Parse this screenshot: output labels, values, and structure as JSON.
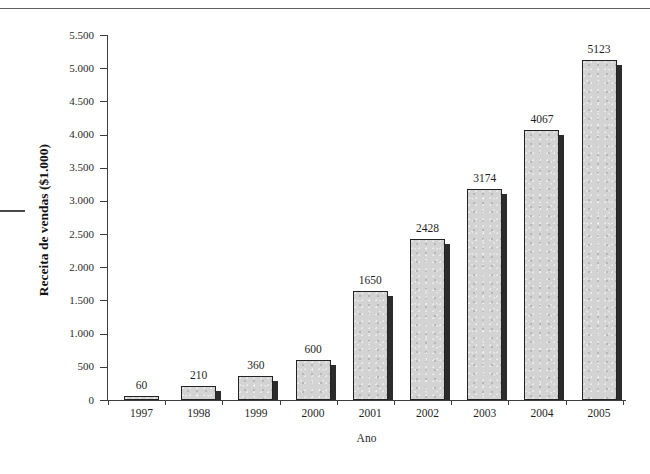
{
  "figure": {
    "title_remnant": "Crescimento da receita de vendas, 1997-2005",
    "background_color": "#ffffff",
    "bar_fill_color": "#d3d3d3",
    "bar_border_color": "#232323",
    "bar_shadow_color": "#2b2b2b",
    "axis_color": "#3d3d3d"
  },
  "chart_data": {
    "type": "bar",
    "title": "Crescimento da receita de vendas, 1997-2005",
    "xlabel": "Ano",
    "ylabel": "Receita de vendas ($1.000)",
    "categories": [
      "1997",
      "1998",
      "1999",
      "2000",
      "2001",
      "2002",
      "2003",
      "2004",
      "2005"
    ],
    "values": [
      60,
      210,
      360,
      600,
      1650,
      2428,
      3174,
      4067,
      5123
    ],
    "value_labels": [
      "60",
      "210",
      "360",
      "600",
      "1650",
      "2428",
      "3174",
      "4067",
      "5123"
    ],
    "ylim": [
      0,
      5500
    ],
    "ytick_values": [
      0,
      500,
      1000,
      1500,
      2000,
      2500,
      3000,
      3500,
      4000,
      4500,
      5000,
      5500
    ],
    "ytick_labels": [
      "0",
      "500",
      "1.000",
      "1.500",
      "2.000",
      "2.500",
      "3.000",
      "3.500",
      "4.000",
      "4.500",
      "5.000",
      "5.500"
    ],
    "grid": false,
    "legend": null
  }
}
